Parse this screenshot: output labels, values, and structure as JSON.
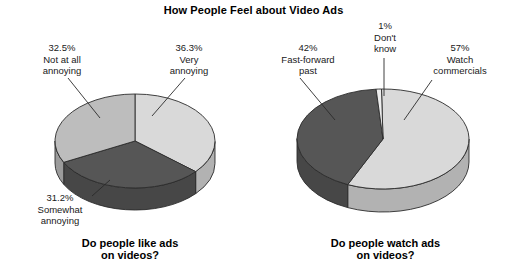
{
  "chart_data": [
    {
      "type": "pie",
      "title": "How People Feel about Video Ads",
      "caption_line1": "Do people like ads",
      "caption_line2": "on videos?",
      "categories": [
        "Very annoying",
        "Not at all annoying",
        "Somewhat annoying"
      ],
      "values": [
        36.3,
        32.5,
        31.2
      ],
      "value_labels": [
        "36.3%",
        "32.5%",
        "31.2%"
      ],
      "colors": [
        "#d9d9d9",
        "#bdbdbd",
        "#565656"
      ],
      "legend": "none",
      "labels": [
        {
          "pct": "32.5%",
          "line1": "Not at all",
          "line2": "annoying"
        },
        {
          "pct": "36.3%",
          "line1": "Very",
          "line2": "annoying"
        },
        {
          "pct": "31.2%",
          "line1": "Somewhat",
          "line2": "annoying"
        }
      ]
    },
    {
      "type": "pie",
      "title": "How People Feel about Video Ads",
      "caption_line1": "Do people watch ads",
      "caption_line2": "on videos?",
      "categories": [
        "Watch commercials",
        "Fast-forward past",
        "Don't know"
      ],
      "values": [
        57,
        42,
        1
      ],
      "value_labels": [
        "57%",
        "42%",
        "1%"
      ],
      "colors": [
        "#d9d9d9",
        "#565656",
        "#ededed"
      ],
      "legend": "none",
      "labels": [
        {
          "pct": "42%",
          "line1": "Fast-forward",
          "line2": "past"
        },
        {
          "pct": "1%",
          "line1": "Don't",
          "line2": "know"
        },
        {
          "pct": "57%",
          "line1": "Watch",
          "line2": "commercials"
        }
      ]
    }
  ],
  "title": "How People Feel about Video Ads",
  "left_chart": {
    "caption_line1": "Do people like ads",
    "caption_line2": "on videos?",
    "label_notatall": {
      "pct": "32.5%",
      "line1": "Not at all",
      "line2": "annoying"
    },
    "label_very": {
      "pct": "36.3%",
      "line1": "Very",
      "line2": "annoying"
    },
    "label_somewhat": {
      "pct": "31.2%",
      "line1": "Somewhat",
      "line2": "annoying"
    }
  },
  "right_chart": {
    "caption_line1": "Do people watch ads",
    "caption_line2": "on videos?",
    "label_fastforward": {
      "pct": "42%",
      "line1": "Fast-forward",
      "line2": "past"
    },
    "label_dontknow": {
      "pct": "1%",
      "line1": "Don't",
      "line2": "know"
    },
    "label_watch": {
      "pct": "57%",
      "line1": "Watch",
      "line2": "commercials"
    }
  }
}
